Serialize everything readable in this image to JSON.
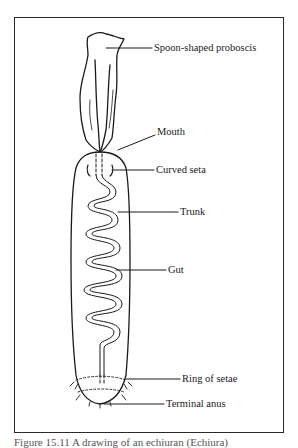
{
  "figure": {
    "caption": "Figure 15.11 A drawing of an echiuran (Echiura)"
  },
  "labels": [
    {
      "id": "proboscis",
      "text": "Spoon-shaped proboscis"
    },
    {
      "id": "mouth",
      "text": "Mouth"
    },
    {
      "id": "curved-seta",
      "text": "Curved seta"
    },
    {
      "id": "trunk",
      "text": "Trunk"
    },
    {
      "id": "gut",
      "text": "Gut"
    },
    {
      "id": "ring-of-setae",
      "text": "Ring of setae"
    },
    {
      "id": "terminal-anus",
      "text": "Terminal anus"
    }
  ],
  "colors": {
    "line": "#1a1a1a",
    "background": "#ffffff"
  }
}
